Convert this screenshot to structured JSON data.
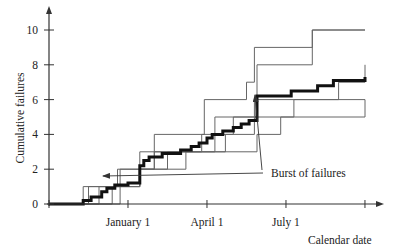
{
  "chart_data": {
    "type": "line",
    "title": "",
    "xlabel": "Calendar date",
    "ylabel": "Cumulative failures",
    "x_units": "months from origin",
    "xlim": [
      0,
      12.6
    ],
    "ylim": [
      0,
      11
    ],
    "yticks": [
      0,
      2,
      4,
      6,
      8,
      10
    ],
    "xticks": [
      {
        "x": 0,
        "label": ""
      },
      {
        "x": 3,
        "label": "January 1"
      },
      {
        "x": 6,
        "label": "April 1"
      },
      {
        "x": 9,
        "label": "July 1"
      },
      {
        "x": 12,
        "label": ""
      }
    ],
    "grid": false,
    "annotation": {
      "text": "Burst of failures",
      "x": 8.35,
      "y": 1.8,
      "arrows_to": [
        [
          2.0,
          1.6
        ],
        [
          7.85,
          6.3
        ]
      ]
    },
    "series": [
      {
        "name": "mean (bold)",
        "style": "bold",
        "points": [
          [
            0,
            0
          ],
          [
            1.3,
            0
          ],
          [
            1.3,
            0.2
          ],
          [
            1.6,
            0.2
          ],
          [
            1.6,
            0.4
          ],
          [
            2.0,
            0.4
          ],
          [
            2.0,
            0.7
          ],
          [
            2.2,
            0.7
          ],
          [
            2.2,
            0.9
          ],
          [
            2.5,
            0.9
          ],
          [
            2.5,
            1.1
          ],
          [
            3.0,
            1.1
          ],
          [
            3.0,
            1.2
          ],
          [
            3.45,
            1.2
          ],
          [
            3.45,
            2.2
          ],
          [
            3.6,
            2.2
          ],
          [
            3.6,
            2.5
          ],
          [
            3.8,
            2.5
          ],
          [
            3.8,
            2.7
          ],
          [
            4.3,
            2.7
          ],
          [
            4.3,
            2.9
          ],
          [
            5.0,
            2.9
          ],
          [
            5.0,
            3.1
          ],
          [
            5.4,
            3.1
          ],
          [
            5.4,
            3.3
          ],
          [
            5.7,
            3.3
          ],
          [
            5.7,
            3.5
          ],
          [
            6.0,
            3.5
          ],
          [
            6.0,
            3.8
          ],
          [
            6.2,
            3.8
          ],
          [
            6.2,
            4.0
          ],
          [
            6.6,
            4.0
          ],
          [
            6.6,
            4.2
          ],
          [
            7.0,
            4.2
          ],
          [
            7.0,
            4.4
          ],
          [
            7.3,
            4.4
          ],
          [
            7.3,
            4.6
          ],
          [
            7.6,
            4.6
          ],
          [
            7.6,
            4.8
          ],
          [
            7.9,
            4.8
          ],
          [
            7.9,
            6.2
          ],
          [
            9.2,
            6.2
          ],
          [
            9.2,
            6.5
          ],
          [
            10.2,
            6.5
          ],
          [
            10.2,
            6.8
          ],
          [
            10.8,
            6.8
          ],
          [
            10.8,
            7.1
          ],
          [
            12.0,
            7.1
          ],
          [
            12.0,
            7.3
          ]
        ]
      },
      {
        "name": "s1",
        "style": "thin",
        "points": [
          [
            0,
            0
          ],
          [
            1.3,
            0
          ],
          [
            1.3,
            1
          ],
          [
            2.6,
            1
          ],
          [
            2.6,
            2
          ],
          [
            4.0,
            2
          ],
          [
            4.0,
            3
          ],
          [
            5.8,
            3
          ],
          [
            5.8,
            4
          ],
          [
            7.0,
            4
          ],
          [
            7.0,
            5
          ],
          [
            9.3,
            5
          ],
          [
            9.3,
            6
          ],
          [
            12.0,
            6
          ]
        ]
      },
      {
        "name": "s2",
        "style": "thin",
        "points": [
          [
            0,
            0
          ],
          [
            1.5,
            0
          ],
          [
            1.5,
            1
          ],
          [
            3.45,
            1
          ],
          [
            3.45,
            3
          ],
          [
            6.3,
            3
          ],
          [
            6.3,
            5
          ],
          [
            7.8,
            5
          ],
          [
            7.8,
            6
          ],
          [
            11.0,
            6
          ],
          [
            11.0,
            7
          ],
          [
            12.0,
            7
          ],
          [
            12.0,
            8
          ]
        ]
      },
      {
        "name": "s3",
        "style": "thin",
        "points": [
          [
            0,
            0
          ],
          [
            1.9,
            0
          ],
          [
            1.9,
            1
          ],
          [
            3.45,
            1
          ],
          [
            3.45,
            2
          ],
          [
            4.5,
            2
          ],
          [
            4.5,
            3
          ],
          [
            7.9,
            3
          ],
          [
            7.9,
            4
          ],
          [
            8.8,
            4
          ],
          [
            8.8,
            5
          ],
          [
            12.0,
            5
          ],
          [
            12.0,
            6
          ]
        ]
      },
      {
        "name": "s4",
        "style": "thin",
        "points": [
          [
            0,
            0
          ],
          [
            2.4,
            0
          ],
          [
            2.4,
            1
          ],
          [
            3.45,
            1
          ],
          [
            3.45,
            2
          ],
          [
            5.2,
            2
          ],
          [
            5.2,
            3
          ],
          [
            6.7,
            3
          ],
          [
            6.7,
            4
          ],
          [
            7.8,
            4
          ],
          [
            7.8,
            5
          ],
          [
            7.9,
            5
          ],
          [
            7.9,
            8
          ],
          [
            10.0,
            8
          ],
          [
            10.0,
            10
          ],
          [
            12.0,
            10
          ]
        ]
      },
      {
        "name": "s5",
        "style": "thin",
        "points": [
          [
            0,
            0
          ],
          [
            2.7,
            0
          ],
          [
            2.7,
            2
          ],
          [
            4.0,
            2
          ],
          [
            4.0,
            4
          ],
          [
            5.9,
            4
          ],
          [
            5.9,
            6
          ],
          [
            7.5,
            6
          ],
          [
            7.5,
            7
          ],
          [
            7.8,
            7
          ],
          [
            7.8,
            9
          ],
          [
            10.0,
            9
          ],
          [
            10.0,
            10
          ],
          [
            12.0,
            10
          ]
        ]
      }
    ]
  }
}
